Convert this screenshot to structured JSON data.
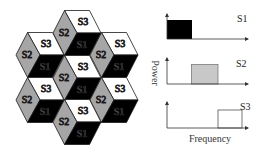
{
  "figure": {
    "hex_layout": {
      "description": "Seven hexagonal cells, each divided into three rhombic sectors",
      "sector_labels": {
        "top": "S3",
        "left": "S2",
        "bottom_right": "S1"
      },
      "cells": [
        {
          "position": "top",
          "s3": "S3",
          "s2": "S2",
          "s1": "S1"
        },
        {
          "position": "upper-left",
          "s3": "S3",
          "s2": "S2",
          "s1": "S1"
        },
        {
          "position": "upper-right",
          "s3": "S3",
          "s2": "S2",
          "s1": "S1"
        },
        {
          "position": "center",
          "s3": "S3",
          "s2": "S2",
          "s1": "S1"
        },
        {
          "position": "lower-left",
          "s3": "S3",
          "s2": "S2",
          "s1": "S1"
        },
        {
          "position": "lower-right",
          "s3": "S3",
          "s2": "S2",
          "s1": "S1"
        },
        {
          "position": "bottom",
          "s3": "S3",
          "s2": "S2",
          "s1": "S1"
        }
      ],
      "colors": {
        "S1": "#000000",
        "S2": "#a6a6a6",
        "S3": "#ffffff"
      }
    },
    "spectrum": {
      "y_axis_label": "Power",
      "x_axis_label": "Frequency",
      "panels": [
        {
          "label": "S1",
          "band": "low",
          "fill": "#000000"
        },
        {
          "label": "S2",
          "band": "mid",
          "fill": "#c8c8c8"
        },
        {
          "label": "S3",
          "band": "high",
          "fill": "#ffffff"
        }
      ]
    }
  }
}
